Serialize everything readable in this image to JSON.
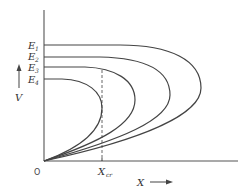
{
  "diagram": {
    "y_axis_label": "V",
    "x_axis_label": "X",
    "origin_label": "O",
    "critical_x_label": "X",
    "critical_x_subscript": "cr",
    "curves": [
      {
        "name": "E1",
        "label": "E",
        "subscript": "1"
      },
      {
        "name": "E2",
        "label": "E",
        "subscript": "2"
      },
      {
        "name": "E3",
        "label": "E",
        "subscript": "3"
      },
      {
        "name": "E4",
        "label": "E",
        "subscript": "4"
      }
    ],
    "colors": {
      "line": "#444444",
      "background": "#ffffff"
    }
  }
}
